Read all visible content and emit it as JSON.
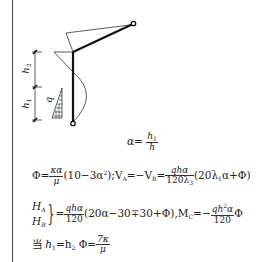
{
  "diagram": {
    "labels": {
      "h2": "h",
      "h2_sub": "2",
      "h1": "h",
      "h1_sub": "1",
      "q": "q"
    }
  },
  "formulas": {
    "alpha": {
      "lhs": "α=",
      "num": "h",
      "num_sub": "1",
      "den": "h"
    },
    "line1": {
      "phi": "Φ=",
      "frac1_num": "κα",
      "frac1_den": "μ",
      "part1": "(10−3α",
      "part1_sup": "2",
      "part1_end": ");V",
      "va_sub": "A",
      "eq": "=−V",
      "vb_sub": "B",
      "eq2": "=",
      "frac2_num": "qhα",
      "frac2_den": "120λ",
      "frac2_den_sub": "3",
      "part2": "(20λ",
      "part2_sub": "1",
      "part2_end": "α+Φ)"
    },
    "line2": {
      "ha": "H",
      "ha_sub": "A",
      "hb": "H",
      "hb_sub": "B",
      "eq": "=",
      "frac_num": "qhα",
      "frac_den": "120",
      "body": "(20α−30∓30+Φ),M",
      "mc_sub": "C",
      "eq2": "=−",
      "frac2_num_a": "qh",
      "frac2_num_sup": "2",
      "frac2_num_b": "α",
      "frac2_den": "120",
      "tail": "Φ"
    },
    "line3": {
      "when": "当",
      "h1": "h",
      "h1_sub": "1",
      "eq": "=h",
      "h2_sub": "2",
      "phi": " Φ=",
      "frac_num": "7κ",
      "frac_den": "μ"
    }
  }
}
